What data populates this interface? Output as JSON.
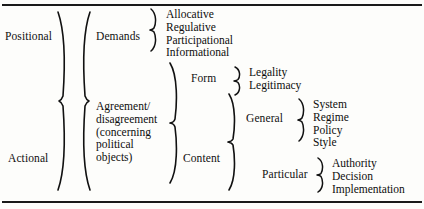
{
  "figure": {
    "type": "hierarchical-brace-tree",
    "title": "",
    "rules": {
      "top": true,
      "bottom": true
    },
    "level1": [
      {
        "label": "Positional"
      },
      {
        "label": "Actional"
      }
    ],
    "level2": [
      {
        "label": "Demands"
      },
      {
        "label": "Agreement/\ndisagreement\n(concerning\npolitical\nobjects)",
        "lines": [
          "Agreement/",
          "disagreement",
          "(concerning",
          "political",
          "objects)"
        ]
      }
    ],
    "level3": [
      {
        "label": "Form"
      },
      {
        "label": "Content"
      }
    ],
    "level4": [
      {
        "label": "General"
      },
      {
        "label": "Particular"
      }
    ],
    "demands_items": [
      "Allocative",
      "Regulative",
      "Participational",
      "Informational"
    ],
    "form_items": [
      "Legality",
      "Legitimacy"
    ],
    "general_items": [
      "System",
      "Regime",
      "Policy",
      "Style"
    ],
    "particular_items": [
      "Authority",
      "Decision",
      "Implementation"
    ],
    "colors": {
      "ink": "#101010",
      "paper": "#fdfdfb",
      "rule": "#1a1a1a"
    }
  }
}
